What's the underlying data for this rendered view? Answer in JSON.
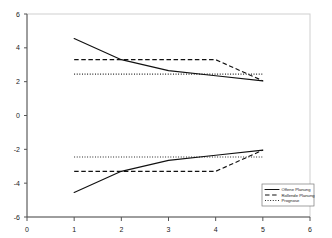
{
  "chart_data": {
    "type": "line",
    "title": "",
    "xlabel": "",
    "ylabel": "",
    "xlim": [
      0,
      6
    ],
    "ylim": [
      -6,
      6
    ],
    "grid": false,
    "legend_position": "bottom-right",
    "x_ticks": [
      "0",
      "1",
      "2",
      "3",
      "4",
      "5",
      "6"
    ],
    "y_ticks": [
      "6",
      "4",
      "2",
      "0",
      "-2",
      "-4",
      "-6"
    ],
    "x": [
      1,
      2,
      3,
      4,
      5
    ],
    "series": [
      {
        "name": "Offene Planung",
        "style": "solid",
        "bound": "upper",
        "values": [
          4.55,
          3.3,
          2.65,
          2.35,
          2.05
        ]
      },
      {
        "name": "Offene Planung",
        "style": "solid",
        "bound": "lower",
        "values": [
          -4.55,
          -3.3,
          -2.65,
          -2.35,
          -2.05
        ]
      },
      {
        "name": "Rollende Planung",
        "style": "dashed",
        "bound": "upper",
        "values": [
          3.3,
          3.3,
          3.3,
          3.3,
          2.05
        ]
      },
      {
        "name": "Rollende Planung",
        "style": "dashed",
        "bound": "lower",
        "values": [
          -3.3,
          -3.3,
          -3.3,
          -3.3,
          -2.05
        ]
      },
      {
        "name": "Prognose",
        "style": "dotted",
        "bound": "upper",
        "values": [
          2.45,
          2.45,
          2.45,
          2.45,
          2.45
        ]
      },
      {
        "name": "Prognose",
        "style": "dotted",
        "bound": "lower",
        "values": [
          -2.45,
          -2.45,
          -2.45,
          -2.45,
          -2.45
        ]
      }
    ],
    "legend": [
      {
        "label": "Offene Planung",
        "style": "solid"
      },
      {
        "label": "Rollende Planung",
        "style": "dashed"
      },
      {
        "label": "Prognose",
        "style": "dotted"
      }
    ]
  },
  "axis": {
    "y_tick_6": "6",
    "y_tick_4": "4",
    "y_tick_2": "2",
    "y_tick_0": "0",
    "y_tick_m2": "-2",
    "y_tick_m4": "-4",
    "y_tick_m6": "-6",
    "x_tick_0": "0",
    "x_tick_1": "1",
    "x_tick_2": "2",
    "x_tick_3": "3",
    "x_tick_4": "4",
    "x_tick_5": "5",
    "x_tick_6": "6"
  },
  "legend": {
    "item_1": "Offene Planung",
    "item_2": "Rollende Planung",
    "item_3": "Prognose"
  },
  "colors": {
    "line": "#111111",
    "axis": "#555555",
    "frame": "#cfcfcf",
    "background": "#ffffff"
  }
}
